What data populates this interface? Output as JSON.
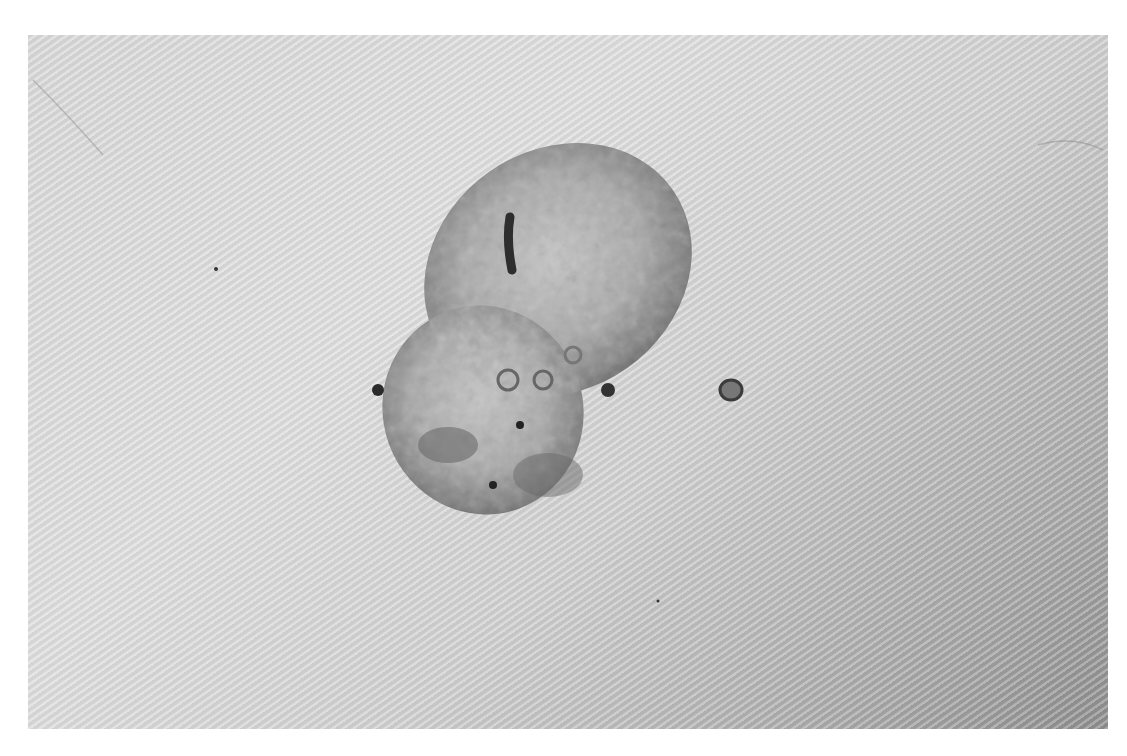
{
  "image": {
    "description": "Grayscale clinical photograph of a raised, irregular, lobulated skin lesion on textured skin, with a small satellite papule to the right",
    "colors": {
      "background": "#ffffff",
      "skin_light": "#dedede",
      "skin_dark": "#8e8e8e",
      "lesion_mid": "#9a9a9a",
      "lesion_dark": "#3a3a3a"
    }
  }
}
